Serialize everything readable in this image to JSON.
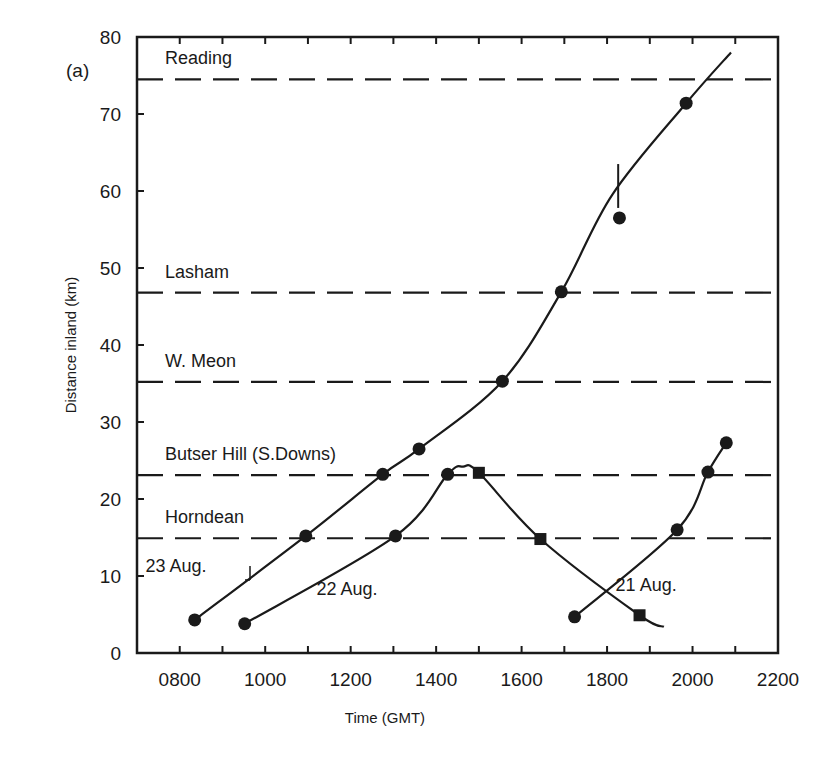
{
  "panel_label": "(a)",
  "chart_data": {
    "type": "line",
    "title": "",
    "xlabel": "Time (GMT)",
    "ylabel": "Distance inland (km)",
    "xlim": [
      700,
      2200
    ],
    "ylim": [
      0,
      80
    ],
    "x_ticks": [
      "0800",
      "1000",
      "1200",
      "1400",
      "1600",
      "1800",
      "2000",
      "2200"
    ],
    "x_tick_values": [
      800,
      1000,
      1200,
      1400,
      1600,
      1800,
      2000,
      2200
    ],
    "y_ticks": [
      "0",
      "10",
      "20",
      "30",
      "40",
      "50",
      "60",
      "70",
      "80"
    ],
    "y_tick_values": [
      0,
      10,
      20,
      30,
      40,
      50,
      60,
      70,
      80
    ],
    "grid": false,
    "reference_lines": [
      {
        "name": "Reading",
        "y": 74.5
      },
      {
        "name": "Lasham",
        "y": 46.8
      },
      {
        "name": "W. Meon",
        "y": 35.2
      },
      {
        "name": "Butser Hill (S. Downs)",
        "y": 23.1
      },
      {
        "name": "Horndean",
        "y": 14.9
      }
    ],
    "series": [
      {
        "name": "23 Aug.",
        "marker": "circle",
        "points": [
          {
            "x": 835,
            "y": 4.3
          },
          {
            "x": 1095,
            "y": 15.2
          },
          {
            "x": 1275,
            "y": 23.2
          },
          {
            "x": 1360,
            "y": 26.5
          },
          {
            "x": 1555,
            "y": 35.3
          },
          {
            "x": 1693,
            "y": 46.9
          },
          {
            "x": 1829,
            "y": 56.5
          },
          {
            "x": 1985,
            "y": 71.4
          }
        ],
        "curve_end": {
          "x": 2090,
          "y": 78.0
        },
        "annotation": "vertical tick mark near 1825 at ~60 km"
      },
      {
        "name": "22 Aug.",
        "marker": "circle (rising) / square (falling)",
        "points": [
          {
            "x": 952,
            "y": 3.8,
            "marker": "circle"
          },
          {
            "x": 1305,
            "y": 15.2,
            "marker": "circle"
          },
          {
            "x": 1427,
            "y": 23.2,
            "marker": "circle"
          },
          {
            "x": 1500,
            "y": 23.4,
            "marker": "square"
          },
          {
            "x": 1644,
            "y": 14.8,
            "marker": "square"
          },
          {
            "x": 1876,
            "y": 4.9,
            "marker": "square"
          }
        ],
        "curve_end": {
          "x": 1933,
          "y": 3.4
        }
      },
      {
        "name": "21 Aug.",
        "marker": "circle",
        "points": [
          {
            "x": 1724,
            "y": 4.7
          },
          {
            "x": 1964,
            "y": 16.0
          },
          {
            "x": 2036,
            "y": 23.5
          },
          {
            "x": 2079,
            "y": 27.3
          }
        ]
      }
    ],
    "series_labels": [
      {
        "text": "23 Aug.",
        "x": 720,
        "y": 10.5
      },
      {
        "text": "22 Aug.",
        "x": 1120,
        "y": 7.5
      },
      {
        "text": "21 Aug.",
        "x": 1820,
        "y": 8.0
      }
    ]
  }
}
